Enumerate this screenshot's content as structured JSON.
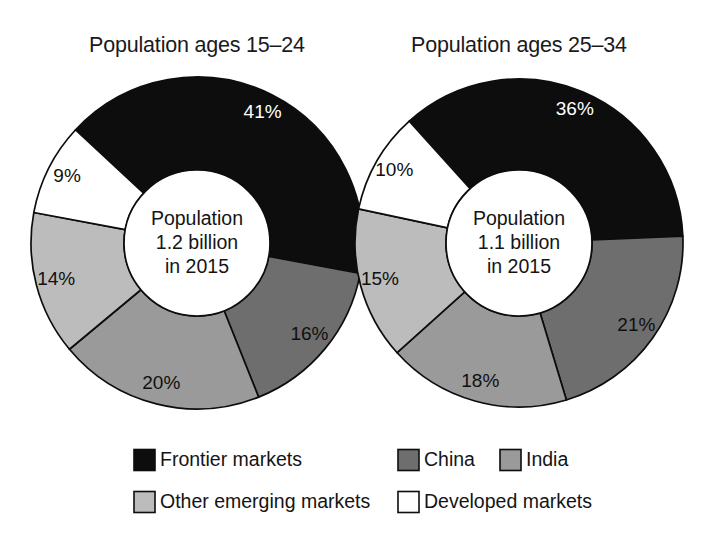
{
  "figure": {
    "background": "#ffffff",
    "outline_color": "#0d0d0d"
  },
  "legend": {
    "items": [
      {
        "label": "Frontier markets",
        "key": "frontier",
        "color": "#0d0d0d"
      },
      {
        "label": "China",
        "key": "china",
        "color": "#6e6e6e"
      },
      {
        "label": "India",
        "key": "india",
        "color": "#9a9a9a"
      },
      {
        "label": "Other emerging markets",
        "key": "other",
        "color": "#bcbcbc"
      },
      {
        "label": "Developed markets",
        "key": "developed",
        "color": "#ffffff"
      }
    ]
  },
  "chart_data": [
    {
      "type": "pie",
      "title": "Population ages 15–24",
      "center_lines": [
        "Population",
        "1.2 billion",
        "in 2015"
      ],
      "categories": [
        "Frontier markets",
        "China",
        "India",
        "Other emerging markets",
        "Developed markets"
      ],
      "values": [
        41,
        16,
        20,
        14,
        9
      ],
      "labels": [
        "41%",
        "16%",
        "20%",
        "14%",
        "9%"
      ],
      "colors": [
        "#0d0d0d",
        "#6e6e6e",
        "#9a9a9a",
        "#bcbcbc",
        "#ffffff"
      ],
      "label_on_dark": [
        true,
        false,
        false,
        false,
        false
      ],
      "unit": "percent",
      "legend_position": "bottom"
    },
    {
      "type": "pie",
      "title": "Population ages 25–34",
      "center_lines": [
        "Population",
        "1.1 billion",
        "in 2015"
      ],
      "categories": [
        "Frontier markets",
        "China",
        "India",
        "Other emerging markets",
        "Developed markets"
      ],
      "values": [
        36,
        21,
        18,
        15,
        10
      ],
      "labels": [
        "36%",
        "21%",
        "18%",
        "15%",
        "10%"
      ],
      "colors": [
        "#0d0d0d",
        "#6e6e6e",
        "#9a9a9a",
        "#bcbcbc",
        "#ffffff"
      ],
      "label_on_dark": [
        true,
        false,
        false,
        false,
        false
      ],
      "unit": "percent",
      "legend_position": "bottom"
    }
  ],
  "geometry": {
    "charts": [
      {
        "cx": 197,
        "cy": 243,
        "r_outer": 166,
        "r_inner": 73,
        "title_x": 197,
        "title_y": 52,
        "start_angle": -47
      },
      {
        "cx": 519,
        "cy": 243,
        "r_outer": 164,
        "r_inner": 73,
        "title_x": 519,
        "title_y": 52,
        "start_angle": -42
      }
    ],
    "label_radius_factor": 0.78,
    "legend": {
      "rows": [
        {
          "y": 460,
          "entries": [
            {
              "key": "frontier",
              "sx": 134,
              "tx": 160
            },
            {
              "key": "china",
              "sx": 398,
              "tx": 424
            },
            {
              "key": "india",
              "sx": 500,
              "tx": 526
            }
          ]
        },
        {
          "y": 502,
          "entries": [
            {
              "key": "other",
              "sx": 134,
              "tx": 160
            },
            {
              "key": "developed",
              "sx": 398,
              "tx": 424
            }
          ]
        }
      ],
      "swatch_size": 21
    }
  }
}
